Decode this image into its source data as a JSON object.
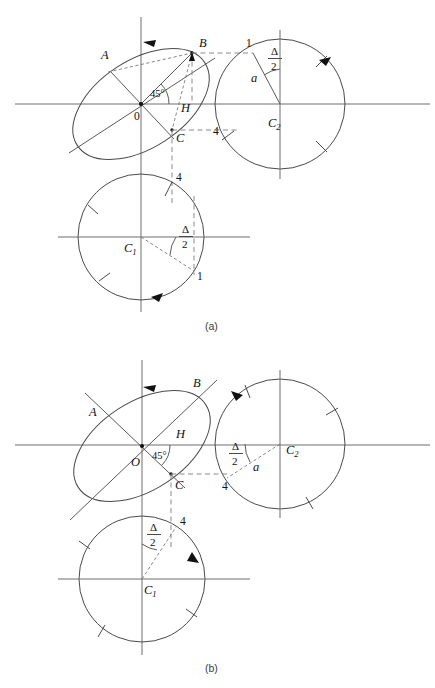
{
  "figure": {
    "kind": "engineering-diagram",
    "background_color": "#ffffff",
    "line_color": "#4a4a4a",
    "axis_color": "#6e6e6e",
    "dashed_color": "#8a8a8a",
    "ink_color": "#111111"
  },
  "panels": [
    {
      "id": "panel-a",
      "caption": "(a)",
      "caption_pos": {
        "x": 205,
        "y": 330
      },
      "ellipse": {
        "name": "inclined-ellipse",
        "center": {
          "x": 141,
          "y": 104
        },
        "rx": 76,
        "ry": 44,
        "rotation_deg": -33,
        "origin_label": "0",
        "origin_label_pos": {
          "x": 134,
          "y": 120
        },
        "points": [
          {
            "label": "A",
            "label_pos": {
              "x": 101,
              "y": 59
            },
            "at": {
              "x": 108,
              "y": 72
            }
          },
          {
            "label": "B",
            "label_pos": {
              "x": 199,
              "y": 47
            },
            "at": {
              "x": 192,
              "y": 53
            }
          },
          {
            "label": "H",
            "label_pos": {
              "x": 181,
              "y": 112
            },
            "at": {
              "x": 178,
              "y": 104
            }
          },
          {
            "label": "C",
            "label_pos": {
              "x": 176,
              "y": 142
            },
            "at": {
              "x": 172,
              "y": 130
            }
          }
        ],
        "angle_label": "45°",
        "angle_label_pos": {
          "x": 157,
          "y": 97
        }
      },
      "axes": {
        "horizontal": {
          "y": 104,
          "x1": 15,
          "x2": 430
        },
        "vertical": {
          "x": 141,
          "y1": 17,
          "y2": 312
        }
      },
      "circle_c2": {
        "name": "circle-C2",
        "center": {
          "x": 280,
          "y": 104
        },
        "r": 65,
        "center_label": "C",
        "center_sub": "2",
        "center_label_pos": {
          "x": 268,
          "y": 127
        },
        "point_label": "1",
        "point_label_pos": {
          "x": 249,
          "y": 46
        },
        "radius_label": "a",
        "radius_label_pos": {
          "x": 253,
          "y": 79
        },
        "angle_label_num": "Δ",
        "angle_label_den": "2",
        "angle_label_pos": {
          "x": 276,
          "y": 59
        },
        "vertical_axis": {
          "x": 280,
          "y1": 30,
          "y2": 179
        }
      },
      "circle_c1": {
        "name": "circle-C1",
        "center": {
          "x": 141,
          "y": 237
        },
        "r": 63,
        "center_label": "C",
        "center_sub": "1",
        "center_label_pos": {
          "x": 126,
          "y": 250
        },
        "point_label": "1",
        "point_label_pos": {
          "x": 198,
          "y": 276
        },
        "angle_label_num": "Δ",
        "angle_label_den": "2",
        "angle_label_pos": {
          "x": 187,
          "y": 237
        },
        "horizontal_axis": {
          "y": 237,
          "x1": 58,
          "x2": 250
        }
      },
      "dimensions": [
        {
          "label": "4",
          "pos": {
            "x": 216,
            "y": 134
          },
          "orientation": "horizontal"
        },
        {
          "label": "4",
          "pos": {
            "x": 178,
            "y": 177
          },
          "orientation": "vertical"
        }
      ]
    },
    {
      "id": "panel-b",
      "caption": "(b)",
      "caption_pos": {
        "x": 205,
        "y": 672
      },
      "ellipse": {
        "name": "inclined-ellipse",
        "center": {
          "x": 142,
          "y": 446
        },
        "rx": 76,
        "ry": 44,
        "rotation_deg": -33,
        "origin_label": "O",
        "origin_label_pos": {
          "x": 135,
          "y": 464
        },
        "points": [
          {
            "label": "A",
            "label_pos": {
              "x": 93,
              "y": 411
            },
            "at": {
              "x": 110,
              "y": 412
            }
          },
          {
            "label": "B",
            "label_pos": {
              "x": 196,
              "y": 384
            },
            "at": {
              "x": 186,
              "y": 392
            }
          },
          {
            "label": "H",
            "label_pos": {
              "x": 181,
              "y": 453
            },
            "at": {
              "x": 178,
              "y": 446
            }
          },
          {
            "label": "C",
            "label_pos": {
              "x": 176,
              "y": 486
            },
            "at": {
              "x": 171,
              "y": 474
            }
          }
        ],
        "angle_label": "45°",
        "angle_label_pos": {
          "x": 159,
          "y": 455
        }
      },
      "axes": {
        "horizontal": {
          "y": 445,
          "x1": 15,
          "x2": 430
        },
        "vertical": {
          "x": 142,
          "y1": 360,
          "y2": 655
        }
      },
      "circle_c2": {
        "name": "circle-C2",
        "center": {
          "x": 280,
          "y": 444
        },
        "r": 65,
        "center_label": "C",
        "center_sub": "2",
        "center_label_pos": {
          "x": 286,
          "y": 454
        },
        "radius_label": "a",
        "radius_label_pos": {
          "x": 256,
          "y": 468
        },
        "angle_label_num": "Δ",
        "angle_label_den": "2",
        "angle_label_pos": {
          "x": 236,
          "y": 454
        },
        "vertical_axis": {
          "x": 280,
          "y1": 370,
          "y2": 518
        }
      },
      "circle_c1": {
        "name": "circle-C1",
        "center": {
          "x": 142,
          "y": 579
        },
        "r": 63,
        "center_label": "C",
        "center_sub": "1",
        "center_label_pos": {
          "x": 146,
          "y": 592
        },
        "angle_label_num": "Δ",
        "angle_label_den": "2",
        "angle_label_pos": {
          "x": 154,
          "y": 535
        },
        "horizontal_axis": {
          "y": 579,
          "x1": 58,
          "x2": 250
        }
      },
      "dimensions": [
        {
          "label": "4",
          "pos": {
            "x": 225,
            "y": 486
          },
          "orientation": "horizontal"
        },
        {
          "label": "4",
          "pos": {
            "x": 182,
            "y": 521
          },
          "orientation": "vertical"
        }
      ]
    }
  ]
}
